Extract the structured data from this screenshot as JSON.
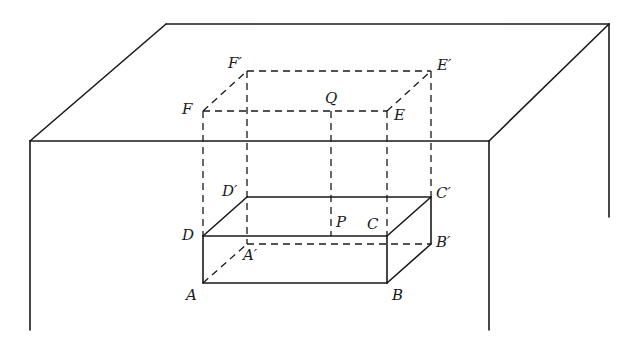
{
  "diagram": {
    "colors": {
      "ink": "#1a1a1a",
      "background": "#ffffff"
    },
    "labels": {
      "A": "A",
      "B": "B",
      "C": "C",
      "D": "D",
      "E": "E",
      "F": "F",
      "A_prime": "A′",
      "B_prime": "B′",
      "C_prime": "C′",
      "D_prime": "D′",
      "E_prime": "E′",
      "F_prime": "F′",
      "P": "P",
      "Q": "Q"
    },
    "points": {
      "A": [
        203,
        283
      ],
      "B": [
        387,
        283
      ],
      "C": [
        387,
        236
      ],
      "D": [
        203,
        236
      ],
      "A_prime": [
        247,
        244
      ],
      "B_prime": [
        431,
        244
      ],
      "C_prime": [
        431,
        197
      ],
      "D_prime": [
        247,
        197
      ],
      "E": [
        387,
        111
      ],
      "F": [
        203,
        111
      ],
      "E_prime": [
        431,
        71
      ],
      "F_prime": [
        247,
        71
      ],
      "P": [
        331,
        236
      ],
      "Q": [
        331,
        111
      ]
    },
    "table": {
      "top_back_left": [
        166,
        24
      ],
      "top_back_right": [
        609,
        24
      ],
      "top_front_left": [
        30,
        141
      ],
      "top_front_right": [
        489,
        141
      ],
      "leg_front_left_bottom": [
        30,
        330
      ],
      "leg_front_right_bottom": [
        489,
        330
      ],
      "leg_back_right_bottom": [
        609,
        217
      ]
    }
  }
}
